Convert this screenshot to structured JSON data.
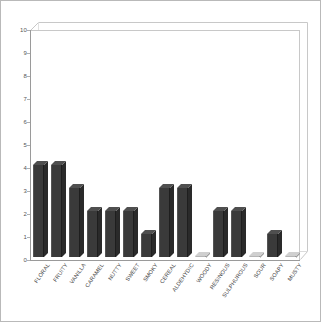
{
  "chart_data": {
    "type": "bar",
    "title": "",
    "subtitle": "",
    "xlabel": "",
    "ylabel": "",
    "ylim": [
      0,
      10
    ],
    "y_ticks": [
      0,
      1,
      2,
      3,
      4,
      5,
      6,
      7,
      8,
      9,
      10
    ],
    "grid": false,
    "legend": null,
    "legend_position": "none",
    "style": "3d-column",
    "categories": [
      "FLORAL",
      "FRUITY",
      "VANILLA",
      "CARAMEL",
      "NUTTY",
      "SWEET",
      "SMOKY",
      "CEREAL",
      "ALDEHYDIC",
      "WOODY",
      "RESINOUS",
      "SULPHUROUS",
      "SOUR",
      "SOAPY",
      "MUSTY"
    ],
    "values": [
      4,
      4,
      3,
      2,
      2,
      2,
      1,
      3,
      3,
      0,
      2,
      2,
      0,
      1,
      0
    ],
    "series": [
      {
        "name": "Count",
        "values": [
          4,
          4,
          3,
          2,
          2,
          2,
          1,
          3,
          3,
          0,
          2,
          2,
          0,
          1,
          0
        ]
      }
    ],
    "colors": {
      "bar_face": "#3a3a3a",
      "bar_top": "#4f4f4f",
      "bar_side": "#2a2a2a",
      "zero_bar": "#b5b5b5",
      "axis": "#9a9a9a",
      "wall": "#c8c8c8",
      "tick_text": "#555555",
      "label_text": "#4a4a4a",
      "background": "#ffffff",
      "frame": "#b9b9b9"
    }
  }
}
